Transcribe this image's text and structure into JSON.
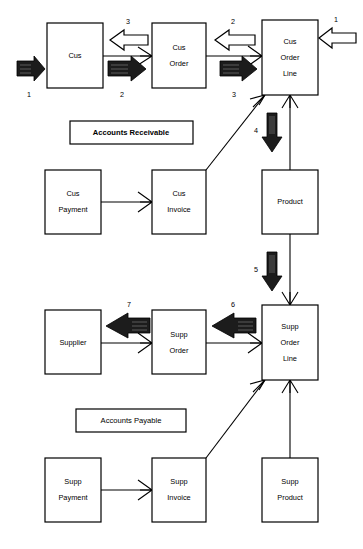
{
  "diagram": {
    "background_color": "#ffffff",
    "line_color": "#000000",
    "entities": [
      {
        "id": "cus",
        "label_lines": [
          "Cus"
        ],
        "x": 47,
        "y": 23,
        "w": 56,
        "h": 65
      },
      {
        "id": "cus-order",
        "label_lines": [
          "Cus",
          "Order"
        ],
        "x": 152,
        "y": 23,
        "w": 54,
        "h": 65
      },
      {
        "id": "cus-order-line",
        "label_lines": [
          "Cus",
          "Order",
          "Line"
        ],
        "x": 262,
        "y": 20,
        "w": 56,
        "h": 75
      },
      {
        "id": "cus-payment",
        "label_lines": [
          "Cus",
          "Payment"
        ],
        "x": 45,
        "y": 170,
        "w": 56,
        "h": 64
      },
      {
        "id": "cus-invoice",
        "label_lines": [
          "Cus",
          "Invoice"
        ],
        "x": 152,
        "y": 170,
        "w": 54,
        "h": 64
      },
      {
        "id": "product",
        "label_lines": [
          "Product"
        ],
        "x": 262,
        "y": 170,
        "w": 56,
        "h": 64
      },
      {
        "id": "supplier",
        "label_lines": [
          "Supplier"
        ],
        "x": 45,
        "y": 310,
        "w": 56,
        "h": 64
      },
      {
        "id": "supp-order",
        "label_lines": [
          "Supp",
          "Order"
        ],
        "x": 152,
        "y": 310,
        "w": 54,
        "h": 64
      },
      {
        "id": "supp-order-line",
        "label_lines": [
          "Supp",
          "Order",
          "Line"
        ],
        "x": 262,
        "y": 305,
        "w": 56,
        "h": 75
      },
      {
        "id": "supp-payment",
        "label_lines": [
          "Supp",
          "Payment"
        ],
        "x": 45,
        "y": 458,
        "w": 56,
        "h": 64
      },
      {
        "id": "supp-invoice",
        "label_lines": [
          "Supp",
          "Invoice"
        ],
        "x": 152,
        "y": 458,
        "w": 54,
        "h": 64
      },
      {
        "id": "supp-product",
        "label_lines": [
          "Supp",
          "Product"
        ],
        "x": 262,
        "y": 458,
        "w": 56,
        "h": 64
      }
    ],
    "groups": [
      {
        "id": "accounts-receivable",
        "label": "Accounts Receivable",
        "x": 70,
        "y": 121,
        "w": 123,
        "h": 23,
        "bold": true
      },
      {
        "id": "accounts-payable",
        "label": "Accounts Payable",
        "x": 76,
        "y": 409,
        "w": 110,
        "h": 23,
        "bold": false
      }
    ],
    "flow_arrows": [
      {
        "id": "flow-1-left",
        "number": "1",
        "style": "solid",
        "direction": "right",
        "x": 17,
        "y": 66,
        "len": 28,
        "label_x": 29,
        "label_y": 95
      },
      {
        "id": "flow-2-cus",
        "number": "2",
        "style": "solid",
        "direction": "right",
        "x": 108,
        "y": 66,
        "len": 40,
        "label_x": 122,
        "label_y": 95
      },
      {
        "id": "flow-3-order",
        "number": "3",
        "style": "solid",
        "direction": "right",
        "x": 220,
        "y": 66,
        "len": 38,
        "label_x": 234,
        "label_y": 95
      },
      {
        "id": "flow-3-back",
        "number": "3",
        "style": "hollow",
        "direction": "left",
        "x": 110,
        "y": 36,
        "len": 38,
        "label_x": 128,
        "label_y": 22
      },
      {
        "id": "flow-2-back",
        "number": "2",
        "style": "hollow",
        "direction": "left",
        "x": 215,
        "y": 36,
        "len": 40,
        "label_x": 233,
        "label_y": 22
      },
      {
        "id": "flow-1-right",
        "number": "1",
        "style": "hollow",
        "direction": "left",
        "x": 318,
        "y": 33,
        "len": 36,
        "label_x": 335,
        "label_y": 20
      },
      {
        "id": "flow-4",
        "number": "4",
        "style": "solid",
        "direction": "down",
        "x": 272,
        "y": 115,
        "len": 38,
        "label_x": 262,
        "label_y": 131
      },
      {
        "id": "flow-5",
        "number": "5",
        "style": "solid",
        "direction": "down",
        "x": 272,
        "y": 252,
        "len": 38,
        "label_x": 262,
        "label_y": 270
      },
      {
        "id": "flow-6",
        "number": "6",
        "style": "solid",
        "direction": "left",
        "x": 214,
        "y": 322,
        "len": 42,
        "label_x": 233,
        "label_y": 310
      },
      {
        "id": "flow-7",
        "number": "7",
        "style": "solid",
        "direction": "left",
        "x": 108,
        "y": 322,
        "len": 42,
        "label_x": 129,
        "label_y": 310
      }
    ],
    "connections": [
      {
        "id": "cus-to-cus-order",
        "from": "cus",
        "to": "cus-order",
        "crow_at": "to"
      },
      {
        "id": "cus-order-to-cus-order-line",
        "from": "cus-order",
        "to": "cus-order-line",
        "crow_at": "to"
      },
      {
        "id": "cus-payment-to-cus-invoice",
        "from": "cus-payment",
        "to": "cus-invoice",
        "crow_at": "to"
      },
      {
        "id": "cus-order-line-to-cus-invoice",
        "from": "cus-order-line",
        "to": "cus-invoice",
        "crow_at": "from"
      },
      {
        "id": "cus-order-line-to-product",
        "from": "cus-order-line",
        "to": "product",
        "crow_at": "from"
      },
      {
        "id": "product-to-supp-order-line",
        "from": "product",
        "to": "supp-order-line",
        "crow_at": "to"
      },
      {
        "id": "supp-order-to-supplier",
        "from": "supp-order",
        "to": "supplier",
        "crow_at": "from"
      },
      {
        "id": "supp-order-line-to-supp-order",
        "from": "supp-order-line",
        "to": "supp-order",
        "crow_at": "from"
      },
      {
        "id": "supp-payment-to-supp-invoice",
        "from": "supp-payment",
        "to": "supp-invoice",
        "crow_at": "to"
      },
      {
        "id": "supp-order-line-to-supp-invoice",
        "from": "supp-order-line",
        "to": "supp-invoice",
        "crow_at": "from"
      },
      {
        "id": "supp-order-line-to-supp-product",
        "from": "supp-order-line",
        "to": "supp-product",
        "crow_at": "from"
      }
    ]
  }
}
